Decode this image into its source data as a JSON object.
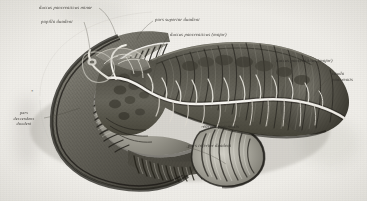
{
  "plate": {
    "title": "Pancreas and duodenum, anterior view with duodenum opened",
    "technique": "steel engraving / stipple",
    "ground_color": "#eeece7",
    "ink_color": "#2e2c28"
  },
  "labels": [
    {
      "id": "ductus-pancreaticus-minor",
      "text": "ductus pancreaticus minor",
      "position": "top-left",
      "x": 39,
      "y": 5
    },
    {
      "id": "papilla-duodeni",
      "text": "papilla duodeni",
      "position": "upper-left",
      "x": 41,
      "y": 19
    },
    {
      "id": "pars-superior-duodeni",
      "text": "pars superior duodeni",
      "position": "top-center",
      "x": 155,
      "y": 17
    },
    {
      "id": "ductus-pancreaticus-major-upper",
      "text": "ductus pancreaticus (major)",
      "position": "top-center-right",
      "x": 170,
      "y": 32
    },
    {
      "id": "ductus-pancreaticus-major-right",
      "text": "ductus pancreaticus (major)",
      "position": "right",
      "x": 276,
      "y": 58
    },
    {
      "id": "cauda-pancreatis",
      "text": "cauda pancreatis",
      "position": "far-right",
      "x": 332,
      "y": 71
    },
    {
      "id": "pars-descendens-duodeni",
      "text": "pars descendens duodeni",
      "position": "left",
      "x": 9,
      "y": 110
    },
    {
      "id": "corpus-pancreatis",
      "text": "corpus pancreatis",
      "position": "bottom-center",
      "x": 203,
      "y": 124
    },
    {
      "id": "pars-inferior-duodeni",
      "text": "pars inferior duodeni",
      "position": "bottom-center",
      "x": 188,
      "y": 143
    }
  ],
  "marks": [
    {
      "id": "asterisk-left",
      "text": "*",
      "x": 31,
      "y": 89
    }
  ],
  "structures": [
    {
      "id": "duodenum-c-loop",
      "name": "duodenum, opened showing plicae circulares"
    },
    {
      "id": "pancreas-head",
      "name": "caput pancreatis"
    },
    {
      "id": "pancreas-body",
      "name": "corpus pancreatis"
    },
    {
      "id": "pancreas-tail",
      "name": "cauda pancreatis"
    },
    {
      "id": "pancreatic-duct",
      "name": "ductus pancreaticus with side branches"
    }
  ]
}
